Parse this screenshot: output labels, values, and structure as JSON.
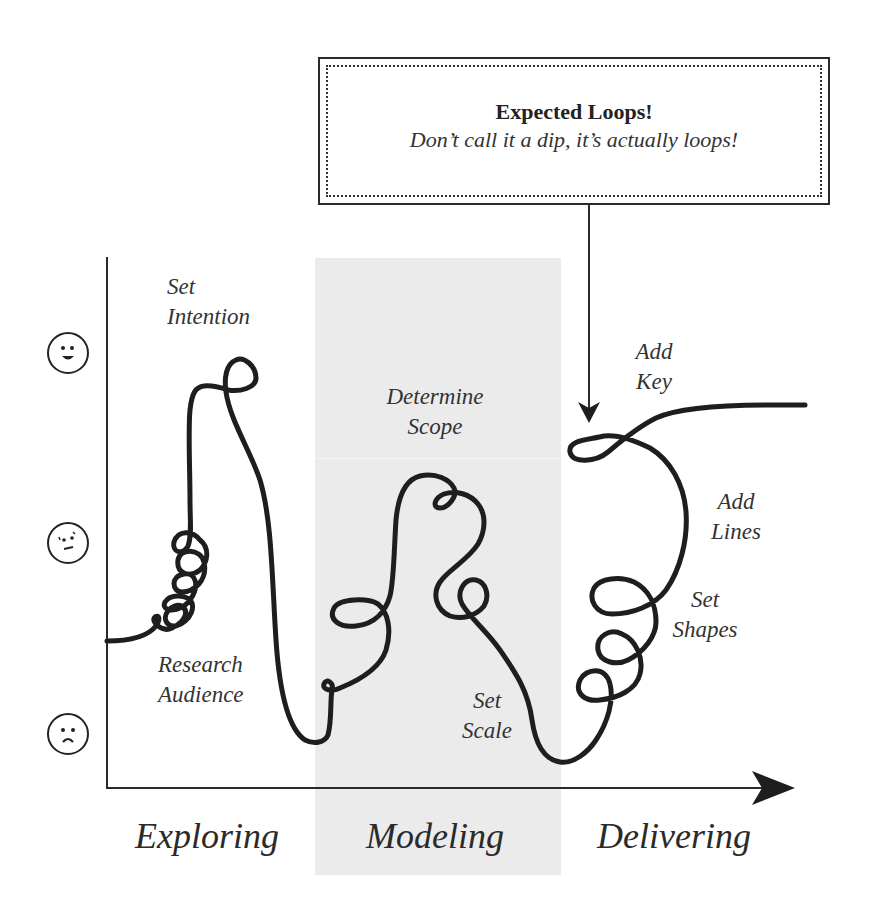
{
  "callout": {
    "title": "Expected Loops!",
    "subtitle": "Don’t call it a dip, it’s actually loops!"
  },
  "y_axis": {
    "levels": [
      {
        "icon": "happy-face-icon",
        "meaning": "positive"
      },
      {
        "icon": "confused-face-icon",
        "meaning": "neutral"
      },
      {
        "icon": "sad-face-icon",
        "meaning": "negative"
      }
    ]
  },
  "x_axis": {
    "phases": [
      {
        "label": "Exploring"
      },
      {
        "label": "Modeling"
      },
      {
        "label": "Delivering"
      }
    ]
  },
  "annotations": [
    {
      "line1": "Set",
      "line2": "Intention"
    },
    {
      "line1": "Research",
      "line2": "Audience"
    },
    {
      "line1": "Determine",
      "line2": "Scope"
    },
    {
      "line1": "Set",
      "line2": "Scale"
    },
    {
      "line1": "Add",
      "line2": "Key"
    },
    {
      "line1": "Add",
      "line2": "Lines"
    },
    {
      "line1": "Set",
      "line2": "Shapes"
    }
  ],
  "colors": {
    "ink": "#1e1e1e",
    "band": "#ebebeb",
    "background": "#ffffff"
  }
}
